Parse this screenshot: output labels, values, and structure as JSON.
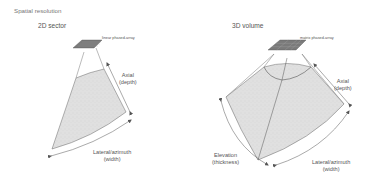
{
  "title": "Spatial resolution",
  "panels": [
    {
      "heading": "2D sector",
      "transducer_label": "linear phased-array",
      "axes": {
        "axial": [
          "Axial",
          "(depth)"
        ],
        "lateral": [
          "Lateral/azimuth",
          "(width)"
        ]
      }
    },
    {
      "heading": "3D volume",
      "transducer_label": "matrix phased-array",
      "axes": {
        "axial": [
          "Axial",
          "(depth)"
        ],
        "lateral": [
          "Lateral/azimuth",
          "(width)"
        ],
        "elevation": [
          "Elevation",
          "(thickness)"
        ]
      }
    }
  ],
  "colors": {
    "fill": "#dcdcdc",
    "outline": "#555555",
    "transducer": "#7a7a7a",
    "text": "#555555"
  }
}
